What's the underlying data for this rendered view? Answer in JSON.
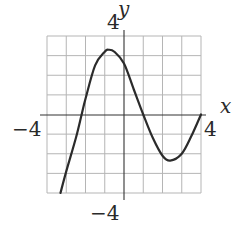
{
  "chart_data": {
    "type": "line",
    "title": "",
    "xlabel": "x",
    "ylabel": "y",
    "xlim": [
      -4,
      4
    ],
    "ylim": [
      -4,
      4
    ],
    "grid": true,
    "grid_step": 1,
    "tick_labels": {
      "x_min": "−4",
      "x_max": "4",
      "y_min": "−4",
      "y_max": "4"
    },
    "series": [
      {
        "name": "f(x)",
        "x": [
          -3.3,
          -3.0,
          -2.5,
          -2.2,
          -2.0,
          -1.5,
          -1.0,
          -0.8,
          -0.5,
          0.0,
          0.5,
          1.0,
          1.5,
          2.0,
          2.4,
          3.0,
          3.5,
          4.0
        ],
        "y": [
          -4.0,
          -2.9,
          -1.2,
          0.0,
          0.8,
          2.5,
          3.2,
          3.3,
          3.2,
          2.6,
          1.3,
          0.0,
          -1.2,
          -2.1,
          -2.35,
          -2.0,
          -1.1,
          0.0
        ]
      }
    ],
    "annotations": {
      "local_max": [
        -0.8,
        3.3
      ],
      "local_min": [
        2.4,
        -2.35
      ],
      "x_intercepts": [
        -2.2,
        1.0,
        4.0
      ]
    },
    "colors": {
      "curve": "#2b2b2b",
      "grid": "#b5b5b5",
      "axis": "#333333"
    }
  }
}
